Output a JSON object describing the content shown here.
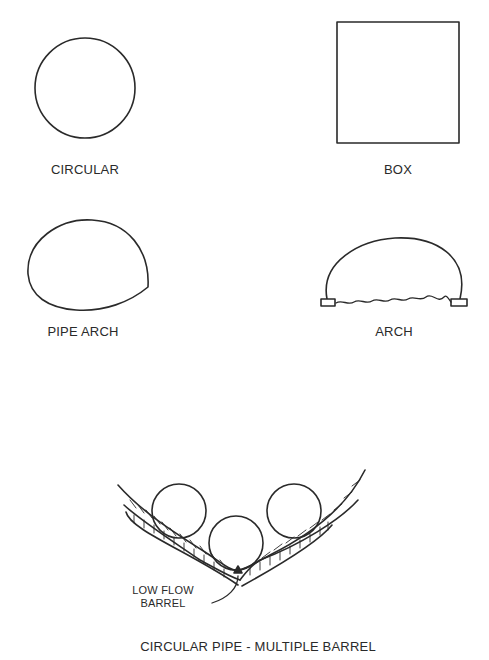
{
  "diagram": {
    "shapes": [
      {
        "id": "circular",
        "label": "CIRCULAR"
      },
      {
        "id": "box",
        "label": "BOX"
      },
      {
        "id": "pipe-arch",
        "label": "PIPE ARCH"
      },
      {
        "id": "arch",
        "label": "ARCH"
      }
    ],
    "multiple_barrel": {
      "label": "CIRCULAR PIPE - MULTIPLE BARREL",
      "callout_line1": "LOW FLOW",
      "callout_line2": "BARREL",
      "barrel_count": 3
    },
    "colors": {
      "stroke": "#2a2a2a",
      "background": "#ffffff"
    }
  }
}
